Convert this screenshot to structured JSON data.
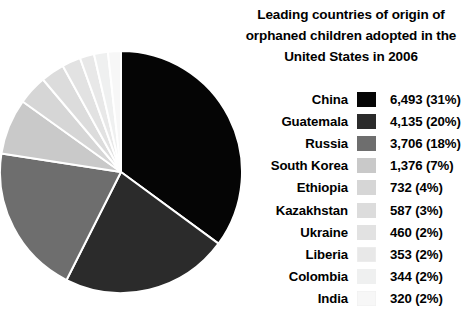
{
  "title": {
    "line1": "Leading countries of origin of",
    "line2": "orphaned children adopted in the",
    "line3": "United States in 2006"
  },
  "chart_data": {
    "type": "pie",
    "title": "Leading countries of origin of orphaned children adopted in the United States in 2006",
    "xlabel": "",
    "ylabel": "",
    "legend_position": "right",
    "start_angle_deg": 0,
    "direction": "clockwise",
    "categories": [
      "China",
      "Guatemala",
      "Russia",
      "South Korea",
      "Ethiopia",
      "Kazakhstan",
      "Ukraine",
      "Liberia",
      "Colombia",
      "India"
    ],
    "values": [
      6493,
      4135,
      3706,
      1376,
      732,
      587,
      460,
      353,
      344,
      320
    ],
    "percentages": [
      31,
      20,
      18,
      7,
      4,
      3,
      2,
      2,
      2,
      2
    ],
    "value_labels": [
      "6,493 (31%)",
      "4,135 (20%)",
      "3,706 (18%)",
      "1,376 (7%)",
      "732 (4%)",
      "587 (3%)",
      "460 (2%)",
      "353 (2%)",
      "344 (2%)",
      "320 (2%)"
    ],
    "colors": [
      "#050505",
      "#2b2b2b",
      "#6e6e6e",
      "#c9c9c9",
      "#d6d6d6",
      "#dcdcdc",
      "#e2e2e2",
      "#e8e8e8",
      "#eff0f0",
      "#f7f7f7"
    ],
    "slice_border_color": "#ffffff"
  },
  "legend": {
    "rows": [
      {
        "label": "China",
        "value": "6,493 (31%)",
        "color": "#050505"
      },
      {
        "label": "Guatemala",
        "value": "4,135 (20%)",
        "color": "#2b2b2b"
      },
      {
        "label": "Russia",
        "value": "3,706 (18%)",
        "color": "#6e6e6e"
      },
      {
        "label": "South Korea",
        "value": "1,376 (7%)",
        "color": "#c9c9c9"
      },
      {
        "label": "Ethiopia",
        "value": "732 (4%)",
        "color": "#d6d6d6"
      },
      {
        "label": "Kazakhstan",
        "value": "587 (3%)",
        "color": "#dcdcdc"
      },
      {
        "label": "Ukraine",
        "value": "460 (2%)",
        "color": "#e2e2e2"
      },
      {
        "label": "Liberia",
        "value": "353 (2%)",
        "color": "#e8e8e8"
      },
      {
        "label": "Colombia",
        "value": "344 (2%)",
        "color": "#eff0f0"
      },
      {
        "label": "India",
        "value": "320 (2%)",
        "color": "#f7f7f7"
      }
    ]
  }
}
